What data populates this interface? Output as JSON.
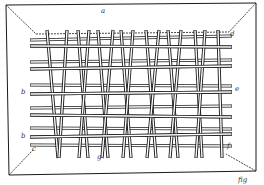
{
  "figure": {
    "kind": "patent line drawing",
    "colors": {
      "ink": "#1a1a1a",
      "paper": "#ffffff",
      "rod_fill": "#ffffff"
    },
    "outer_frame": {
      "tl": [
        6,
        5
      ],
      "tr": [
        256,
        3
      ],
      "br": [
        256,
        171
      ],
      "bl": [
        9,
        175
      ]
    },
    "inner_frame": {
      "tl": [
        36,
        34
      ],
      "tr": [
        229,
        32
      ],
      "br": [
        226,
        154
      ],
      "bl": [
        33,
        150
      ]
    },
    "horizontal_rods": [
      {
        "y_left": 40,
        "y_right": 36
      },
      {
        "y_left": 46,
        "y_right": 47
      },
      {
        "y_left": 62,
        "y_right": 60
      },
      {
        "y_left": 69,
        "y_right": 66
      },
      {
        "y_left": 85,
        "y_right": 86
      },
      {
        "y_left": 94,
        "y_right": 92
      },
      {
        "y_left": 108,
        "y_right": 106
      },
      {
        "y_left": 115,
        "y_right": 117
      },
      {
        "y_left": 128,
        "y_right": 129
      },
      {
        "y_left": 137,
        "y_right": 134
      },
      {
        "y_left": 145,
        "y_right": 146
      }
    ],
    "slanted_rods": [
      {
        "x_top": 47,
        "x_bottom": 58
      },
      {
        "x_top": 67,
        "x_bottom": 59
      },
      {
        "x_top": 78,
        "x_bottom": 88
      },
      {
        "x_top": 89,
        "x_bottom": 79
      },
      {
        "x_top": 98,
        "x_bottom": 108
      },
      {
        "x_top": 113,
        "x_bottom": 102
      },
      {
        "x_top": 121,
        "x_bottom": 131
      },
      {
        "x_top": 133,
        "x_bottom": 123
      },
      {
        "x_top": 146,
        "x_bottom": 156
      },
      {
        "x_top": 159,
        "x_bottom": 147
      },
      {
        "x_top": 168,
        "x_bottom": 178
      },
      {
        "x_top": 181,
        "x_bottom": 170
      },
      {
        "x_top": 195,
        "x_bottom": 202
      },
      {
        "x_top": 205,
        "x_bottom": 196
      },
      {
        "x_top": 218,
        "x_bottom": 222
      }
    ],
    "labels": [
      {
        "text": "a",
        "x": 101,
        "y": 8
      },
      {
        "text": "d",
        "x": 230,
        "y": 31
      },
      {
        "text": "e",
        "x": 235,
        "y": 86
      },
      {
        "text": "b",
        "x": 21,
        "y": 89
      },
      {
        "text": "b",
        "x": 21,
        "y": 133
      },
      {
        "text": "c",
        "x": 32,
        "y": 146
      },
      {
        "text": "g",
        "x": 97,
        "y": 154
      },
      {
        "text": "f",
        "x": 227,
        "y": 143
      },
      {
        "text": "fig",
        "x": 238,
        "y": 177
      }
    ]
  }
}
